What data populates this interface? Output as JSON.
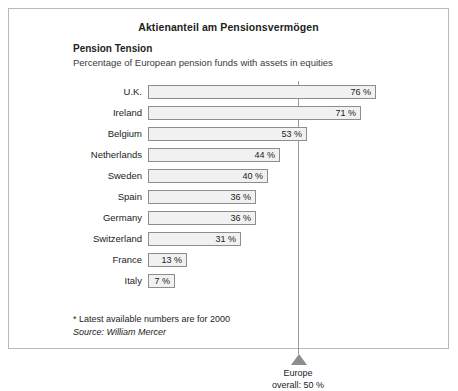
{
  "chart_title": "Aktienanteil am Pensionsvermögen",
  "headline": "Pension Tension",
  "subhead": "Percentage of European pension funds with assets in equities",
  "footnote": "* Latest available numbers are for 2000",
  "source": "Source: William Mercer",
  "reference": {
    "label_line1": "Europe",
    "label_line2": "overall: 50 %",
    "value": 50
  },
  "colors": {
    "bar_fill": "#f1f1f1",
    "bar_border": "#8d8d8d",
    "reference_marker": "#8d8d8d",
    "frame": "#b9b9b9"
  },
  "chart_data": {
    "type": "bar",
    "orientation": "horizontal",
    "title": "Aktienanteil am Pensionsvermögen",
    "subtitle": "Percentage of European pension funds with assets in equities",
    "xlabel": "",
    "ylabel": "",
    "xlim": [
      0,
      80
    ],
    "grid": false,
    "legend": false,
    "categories": [
      "U.K.",
      "Ireland",
      "Belgium",
      "Netherlands",
      "Sweden",
      "Spain",
      "Germany",
      "Switzerland",
      "France",
      "Italy"
    ],
    "values": [
      76,
      71,
      53,
      44,
      40,
      36,
      36,
      31,
      13,
      7
    ],
    "value_labels": [
      "76 %",
      "71 %",
      "53 %",
      "44 %",
      "40 %",
      "36 %",
      "36 %",
      "31 %",
      "13 %",
      "7 %"
    ],
    "annotations": [
      {
        "type": "reference-line",
        "value": 50,
        "text": "Europe overall: 50 %"
      }
    ]
  }
}
